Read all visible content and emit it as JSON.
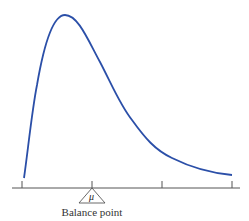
{
  "diagram": {
    "type": "right-skewed density curve with balance point",
    "curve_color": "#2b4fa8",
    "axis_color": "#555555",
    "symbol": "μ",
    "label": "Balance point",
    "tick_count": 4
  }
}
